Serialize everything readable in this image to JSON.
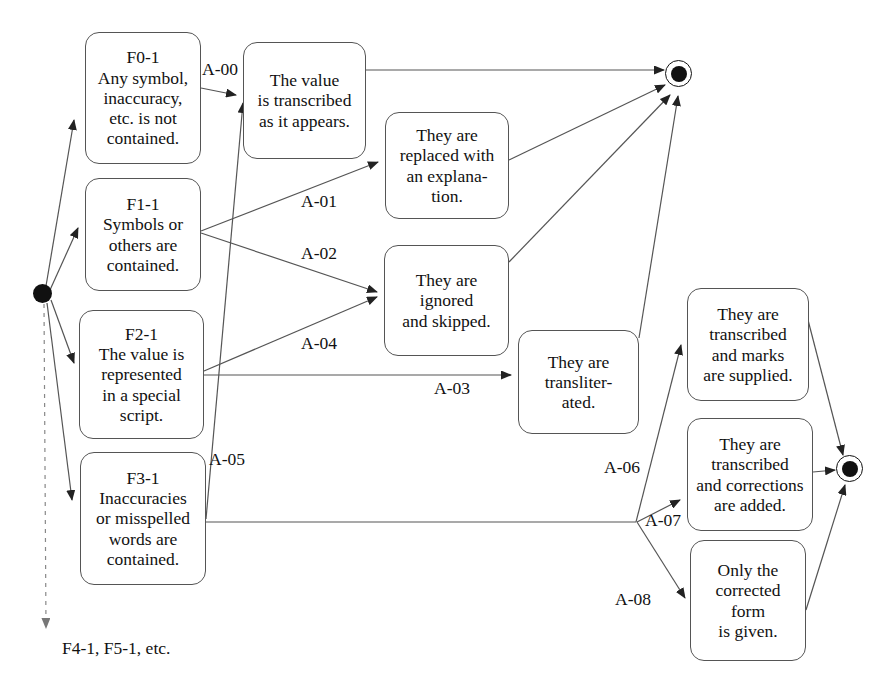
{
  "diagram": {
    "type": "state-transition-diagram",
    "line_color": "#555555",
    "node_color": "#111111"
  },
  "nodes": {
    "initial_state": {
      "name": "initial-state",
      "shape": "filled-circle",
      "x": 42,
      "y": 293
    },
    "final_state_top": {
      "name": "final-state-top",
      "shape": "bullseye",
      "x": 678,
      "y": 73
    },
    "final_state_right": {
      "name": "final-state-right",
      "shape": "bullseye",
      "x": 849,
      "y": 468
    }
  },
  "conditions": [
    {
      "id": "F0-1",
      "code": "F0-1",
      "text": "Any symbol,\ninaccuracy,\netc. is not\ncontained.",
      "x": 85,
      "y": 32,
      "w": 116,
      "h": 132
    },
    {
      "id": "F1-1",
      "code": "F1-1",
      "text": "Symbols or\nothers are\ncontained.",
      "x": 85,
      "y": 178,
      "w": 116,
      "h": 113
    },
    {
      "id": "F2-1",
      "code": "F2-1",
      "text": "The value is\nrepresented\nin a special\nscript.",
      "x": 79,
      "y": 310,
      "w": 125,
      "h": 129
    },
    {
      "id": "F3-1",
      "code": "F3-1",
      "text": "Inaccuracies\nor misspelled\nwords are\ncontained.",
      "x": 80,
      "y": 452,
      "w": 126,
      "h": 133
    }
  ],
  "actions": [
    {
      "id": "act-transcribed-as-appears",
      "text": "The value\nis transcribed\nas it appears.",
      "x": 243,
      "y": 42,
      "w": 123,
      "h": 117
    },
    {
      "id": "act-replaced-explanation",
      "text": "They are\nreplaced with\nan explana-\ntion.",
      "x": 385,
      "y": 112,
      "w": 124,
      "h": 107
    },
    {
      "id": "act-ignored-skipped",
      "text": "They are\nignored\nand skipped.",
      "x": 384,
      "y": 245,
      "w": 125,
      "h": 111
    },
    {
      "id": "act-transliterated",
      "text": "They are\ntransliter-\nated.",
      "x": 518,
      "y": 330,
      "w": 121,
      "h": 104
    },
    {
      "id": "act-marks-supplied",
      "text": "They are\ntranscribed\nand marks\nare supplied.",
      "x": 687,
      "y": 288,
      "w": 122,
      "h": 113
    },
    {
      "id": "act-corrections-added",
      "text": "They are\ntranscribed\nand corrections\nare added.",
      "x": 687,
      "y": 418,
      "w": 126,
      "h": 113
    },
    {
      "id": "act-corrected-form",
      "text": "Only the\ncorrected\nform\nis given.",
      "x": 690,
      "y": 540,
      "w": 116,
      "h": 121
    }
  ],
  "edge_labels": [
    {
      "id": "A-00",
      "text": "A-00",
      "x": 202,
      "y": 59
    },
    {
      "id": "A-01",
      "text": "A-01",
      "x": 301,
      "y": 191
    },
    {
      "id": "A-02",
      "text": "A-02",
      "x": 301,
      "y": 243
    },
    {
      "id": "A-04",
      "text": "A-04",
      "x": 301,
      "y": 333
    },
    {
      "id": "A-03",
      "text": "A-03",
      "x": 434,
      "y": 378
    },
    {
      "id": "A-05",
      "text": "A-05",
      "x": 209,
      "y": 449
    },
    {
      "id": "A-06",
      "text": "A-06",
      "x": 604,
      "y": 457
    },
    {
      "id": "A-07",
      "text": "A-07",
      "x": 645,
      "y": 510
    },
    {
      "id": "A-08",
      "text": "A-08",
      "x": 615,
      "y": 589
    }
  ],
  "notes": [
    {
      "id": "more-conditions",
      "text": "F4-1, F5-1, etc.",
      "x": 62,
      "y": 638
    }
  ]
}
